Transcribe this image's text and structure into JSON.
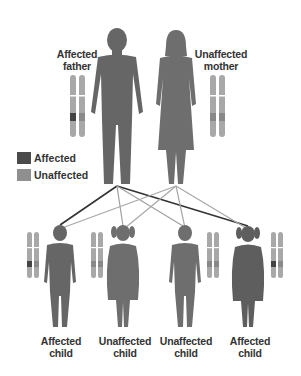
{
  "diagram": {
    "type": "autosomal-dominant-inheritance",
    "colors": {
      "affected": "#4a4a4a",
      "unaffected": "#8f8f8f",
      "figure": "#666666",
      "chromosome": "#a8a8a8",
      "line_affected": "#333333",
      "line_unaffected": "#a0a0a0"
    },
    "parents": [
      {
        "id": "father",
        "label_line1": "Affected",
        "label_line2": "father",
        "status": "affected"
      },
      {
        "id": "mother",
        "label_line1": "Unaffected",
        "label_line2": "mother",
        "status": "unaffected"
      }
    ],
    "legend": [
      {
        "label": "Affected",
        "color": "#4a4a4a"
      },
      {
        "label": "Unaffected",
        "color": "#8f8f8f"
      }
    ],
    "children": [
      {
        "label_line1": "Affected",
        "label_line2": "child",
        "sex": "male",
        "status": "affected"
      },
      {
        "label_line1": "Unaffected",
        "label_line2": "child",
        "sex": "female",
        "status": "unaffected"
      },
      {
        "label_line1": "Unaffected",
        "label_line2": "child",
        "sex": "male",
        "status": "unaffected"
      },
      {
        "label_line1": "Affected",
        "label_line2": "child",
        "sex": "female",
        "status": "affected"
      }
    ]
  }
}
